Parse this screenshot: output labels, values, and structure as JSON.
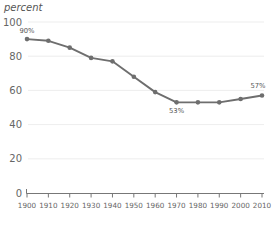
{
  "chart_data": {
    "type": "line",
    "title": "",
    "ylabel": "percent",
    "xlabel": "",
    "categories": [
      1900,
      1910,
      1920,
      1930,
      1940,
      1950,
      1960,
      1970,
      1980,
      1990,
      2000,
      2010
    ],
    "x_tick_labels": [
      "1900",
      "1910",
      "1920",
      "1930",
      "1940",
      "1950",
      "1960",
      "1970",
      "1980",
      "1990",
      "2000",
      "2010"
    ],
    "values": [
      90,
      89,
      85,
      79,
      77,
      68,
      59,
      53,
      53,
      53,
      55,
      57
    ],
    "y_tick_labels": [
      "0",
      "20",
      "40",
      "60",
      "80",
      "100"
    ],
    "y_ticks": [
      0,
      20,
      40,
      60,
      80,
      100
    ],
    "ylim": [
      0,
      100
    ],
    "xlim": [
      1900,
      2010
    ],
    "grid": true,
    "legend": "none",
    "annotations": [
      {
        "text": "90%",
        "x": 1900,
        "y": 90,
        "position": "above"
      },
      {
        "text": "53%",
        "x": 1970,
        "y": 53,
        "position": "below"
      },
      {
        "text": "57%",
        "x": 2010,
        "y": 57,
        "position": "above-left"
      }
    ],
    "colors": {
      "series": "#6e6e6e",
      "grid": "#e8e8e8",
      "axis": "#777777",
      "tick_label": "#666666",
      "axis_title": "#555555",
      "background": "#ffffff"
    }
  }
}
